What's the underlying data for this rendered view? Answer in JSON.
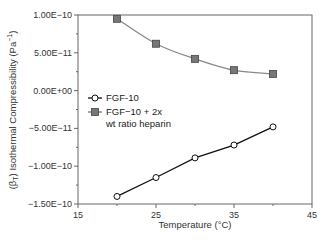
{
  "chart_data": {
    "type": "line",
    "title": "",
    "xlabel": "Temperature (°C)",
    "ylabel": "(βT) Isothermal Compressibility (Pa⁻¹)",
    "xlim": [
      15,
      45
    ],
    "ylim": [
      -1.5e-10,
      1e-10
    ],
    "x_ticks": [
      "15",
      "25",
      "35",
      "45"
    ],
    "y_ticks": [
      "1.00E−10",
      "5.00E−11",
      "0.00E+00",
      "−5.00E−11",
      "−1.00E−10",
      "−1.50E−10"
    ],
    "grid": false,
    "legend_position": "center-left",
    "x": [
      20,
      25,
      30,
      35,
      40
    ],
    "series": [
      {
        "name": "FGF-10",
        "marker": "open-circle",
        "color": "#111111",
        "values": [
          -1.4e-10,
          -1.15e-10,
          -8.9e-11,
          -7.2e-11,
          -4.8e-11
        ]
      },
      {
        "name": "FGF−10 + 2x wt ratio heparin",
        "marker": "filled-square",
        "color": "#777777",
        "values": [
          9.5e-11,
          6.2e-11,
          4.2e-11,
          2.7e-11,
          2.2e-11
        ]
      }
    ]
  },
  "labels": {
    "xlabel": "Temperature (°C)",
    "ylabel_main": "(β",
    "ylabel_sub": "T",
    "ylabel_rest": ") Isothermal Compressibility (Pa",
    "ylabel_sup": "−1",
    "ylabel_end": ")",
    "x_ticks": [
      "15",
      "25",
      "35",
      "45"
    ],
    "y_ticks": [
      "1.00E−10",
      "5.00E−11",
      "0.00E+00",
      "−5.00E−11",
      "−1.00E−10",
      "−1.50E−10"
    ],
    "legend1": "FGF-10",
    "legend2_line1": "FGF−10 + 2x",
    "legend2_line2": "wt ratio heparin"
  }
}
